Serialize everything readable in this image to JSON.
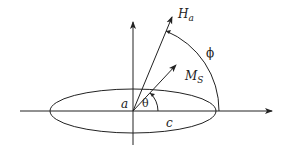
{
  "diagram": {
    "type": "vector-geometry",
    "labels": {
      "field": {
        "main": "H",
        "sub": "a"
      },
      "magnetization": {
        "main": "M",
        "sub": "S"
      },
      "phi": "ϕ",
      "theta": "θ",
      "semi_minor": "a",
      "semi_major": "c"
    },
    "colors": {
      "stroke": "#222222",
      "background": "#ffffff"
    }
  }
}
